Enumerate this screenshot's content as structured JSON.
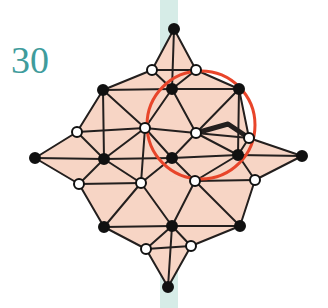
{
  "figure": {
    "label": "30",
    "label_color": "#3f9c9c",
    "background_color": "#ffffff",
    "fill_color": "#f7d5c5",
    "edge_color": "#231f1e",
    "circle_color": "#e8452a",
    "stripe_color": "#cfe9e3",
    "vertex_fill_black": "#111111",
    "vertex_fill_white": "#ffffff",
    "vertex_stroke": "#111111",
    "width": 328,
    "height": 308
  },
  "stripe": {
    "name": "vertical-mint-stripe",
    "x": 160,
    "y": 0,
    "width": 18,
    "height": 308
  },
  "circle": {
    "name": "highlight-circle",
    "cx": 201,
    "cy": 125,
    "r": 54,
    "stroke_width": 3
  },
  "bold_path": {
    "name": "highlighted-edge-path",
    "points": [
      [
        196,
        133
      ],
      [
        228,
        124
      ],
      [
        249,
        138
      ]
    ],
    "stroke_width": 5
  },
  "vertices": [
    {
      "id": "n-tip",
      "x": 174,
      "y": 29,
      "type": "black"
    },
    {
      "id": "nw-out",
      "x": 152,
      "y": 70,
      "type": "white"
    },
    {
      "id": "ne-out",
      "x": 196,
      "y": 70,
      "type": "white"
    },
    {
      "id": "nw-cnr",
      "x": 103,
      "y": 90,
      "type": "black"
    },
    {
      "id": "n-mid",
      "x": 172,
      "y": 89,
      "type": "black"
    },
    {
      "id": "ne-cnr",
      "x": 239,
      "y": 89,
      "type": "black"
    },
    {
      "id": "w-upin",
      "x": 77,
      "y": 132,
      "type": "white"
    },
    {
      "id": "c-upleft",
      "x": 145,
      "y": 128,
      "type": "white"
    },
    {
      "id": "c-upright",
      "x": 196,
      "y": 133,
      "type": "white"
    },
    {
      "id": "e-upin",
      "x": 249,
      "y": 138,
      "type": "white"
    },
    {
      "id": "w-tip",
      "x": 35,
      "y": 158,
      "type": "black"
    },
    {
      "id": "w-mid",
      "x": 104,
      "y": 159,
      "type": "black"
    },
    {
      "id": "c-mid",
      "x": 172,
      "y": 158,
      "type": "black"
    },
    {
      "id": "e-mid",
      "x": 238,
      "y": 155,
      "type": "black"
    },
    {
      "id": "e-tip",
      "x": 302,
      "y": 156,
      "type": "black"
    },
    {
      "id": "w-dnin",
      "x": 79,
      "y": 184,
      "type": "white"
    },
    {
      "id": "c-dnleft",
      "x": 141,
      "y": 183,
      "type": "white"
    },
    {
      "id": "c-dnright",
      "x": 195,
      "y": 181,
      "type": "white"
    },
    {
      "id": "e-dnin",
      "x": 255,
      "y": 180,
      "type": "white"
    },
    {
      "id": "sw-cnr",
      "x": 104,
      "y": 227,
      "type": "black"
    },
    {
      "id": "s-mid",
      "x": 172,
      "y": 226,
      "type": "black"
    },
    {
      "id": "se-cnr",
      "x": 240,
      "y": 226,
      "type": "black"
    },
    {
      "id": "sw-out",
      "x": 146,
      "y": 249,
      "type": "white"
    },
    {
      "id": "se-out",
      "x": 191,
      "y": 246,
      "type": "white"
    },
    {
      "id": "s-tip",
      "x": 168,
      "y": 287,
      "type": "black"
    }
  ],
  "edges": [
    [
      "n-tip",
      "nw-out"
    ],
    [
      "n-tip",
      "ne-out"
    ],
    [
      "n-tip",
      "n-mid"
    ],
    [
      "nw-out",
      "ne-out"
    ],
    [
      "nw-out",
      "n-mid"
    ],
    [
      "ne-out",
      "n-mid"
    ],
    [
      "nw-out",
      "nw-cnr"
    ],
    [
      "ne-out",
      "ne-cnr"
    ],
    [
      "nw-cnr",
      "n-mid"
    ],
    [
      "n-mid",
      "ne-cnr"
    ],
    [
      "nw-cnr",
      "c-upleft"
    ],
    [
      "nw-cnr",
      "w-upin"
    ],
    [
      "w-upin",
      "c-upleft"
    ],
    [
      "c-upleft",
      "n-mid"
    ],
    [
      "n-mid",
      "c-upright"
    ],
    [
      "c-upright",
      "ne-cnr"
    ],
    [
      "ne-cnr",
      "e-upin"
    ],
    [
      "c-upright",
      "e-upin"
    ],
    [
      "c-upleft",
      "c-upright"
    ],
    [
      "w-upin",
      "w-tip"
    ],
    [
      "w-upin",
      "w-mid"
    ],
    [
      "w-tip",
      "w-mid"
    ],
    [
      "w-tip",
      "w-dnin"
    ],
    [
      "w-mid",
      "w-dnin"
    ],
    [
      "w-mid",
      "c-upleft"
    ],
    [
      "c-upleft",
      "c-mid"
    ],
    [
      "c-mid",
      "c-upright"
    ],
    [
      "c-upright",
      "e-mid"
    ],
    [
      "e-mid",
      "e-upin"
    ],
    [
      "e-upin",
      "e-tip"
    ],
    [
      "e-mid",
      "e-tip"
    ],
    [
      "e-tip",
      "e-dnin"
    ],
    [
      "e-mid",
      "e-dnin"
    ],
    [
      "w-mid",
      "c-dnleft"
    ],
    [
      "w-dnin",
      "c-dnleft"
    ],
    [
      "c-upleft",
      "c-dnleft"
    ],
    [
      "c-mid",
      "c-dnleft"
    ],
    [
      "c-mid",
      "c-dnright"
    ],
    [
      "c-dnright",
      "e-mid"
    ],
    [
      "c-dnright",
      "e-dnin"
    ],
    [
      "c-mid",
      "e-mid"
    ],
    [
      "c-mid",
      "w-mid"
    ],
    [
      "w-dnin",
      "sw-cnr"
    ],
    [
      "c-dnleft",
      "sw-cnr"
    ],
    [
      "c-dnleft",
      "s-mid"
    ],
    [
      "c-dnright",
      "s-mid"
    ],
    [
      "c-dnright",
      "se-cnr"
    ],
    [
      "e-dnin",
      "se-cnr"
    ],
    [
      "sw-cnr",
      "s-mid"
    ],
    [
      "s-mid",
      "se-cnr"
    ],
    [
      "sw-cnr",
      "sw-out"
    ],
    [
      "sw-out",
      "s-mid"
    ],
    [
      "s-mid",
      "se-out"
    ],
    [
      "se-out",
      "se-cnr"
    ],
    [
      "sw-out",
      "se-out"
    ],
    [
      "sw-out",
      "s-tip"
    ],
    [
      "se-out",
      "s-tip"
    ],
    [
      "s-mid",
      "s-tip"
    ],
    [
      "nw-cnr",
      "w-mid"
    ],
    [
      "ne-cnr",
      "e-mid"
    ]
  ],
  "faces": [
    [
      "n-tip",
      "nw-out",
      "n-mid"
    ],
    [
      "n-tip",
      "n-mid",
      "ne-out"
    ],
    [
      "nw-out",
      "nw-cnr",
      "n-mid"
    ],
    [
      "ne-out",
      "n-mid",
      "ne-cnr"
    ],
    [
      "nw-cnr",
      "w-upin",
      "c-upleft"
    ],
    [
      "nw-cnr",
      "c-upleft",
      "n-mid"
    ],
    [
      "n-mid",
      "c-upleft",
      "c-upright"
    ],
    [
      "n-mid",
      "c-upright",
      "ne-cnr"
    ],
    [
      "ne-cnr",
      "c-upright",
      "e-upin"
    ],
    [
      "w-tip",
      "w-upin",
      "w-mid"
    ],
    [
      "w-tip",
      "w-mid",
      "w-dnin"
    ],
    [
      "w-upin",
      "c-upleft",
      "w-mid"
    ],
    [
      "c-upleft",
      "c-mid",
      "w-mid"
    ],
    [
      "c-upleft",
      "c-upright",
      "c-mid"
    ],
    [
      "c-upright",
      "e-mid",
      "c-mid"
    ],
    [
      "c-upright",
      "e-upin",
      "e-mid"
    ],
    [
      "e-upin",
      "e-tip",
      "e-mid"
    ],
    [
      "e-mid",
      "e-tip",
      "e-dnin"
    ],
    [
      "w-mid",
      "c-mid",
      "c-dnleft"
    ],
    [
      "w-mid",
      "c-dnleft",
      "w-dnin"
    ],
    [
      "c-mid",
      "c-dnright",
      "c-dnleft"
    ],
    [
      "c-mid",
      "e-mid",
      "c-dnright"
    ],
    [
      "c-dnright",
      "e-mid",
      "e-dnin"
    ],
    [
      "w-dnin",
      "c-dnleft",
      "sw-cnr"
    ],
    [
      "c-dnleft",
      "s-mid",
      "sw-cnr"
    ],
    [
      "c-dnleft",
      "c-dnright",
      "s-mid"
    ],
    [
      "c-dnright",
      "se-cnr",
      "s-mid"
    ],
    [
      "c-dnright",
      "e-dnin",
      "se-cnr"
    ],
    [
      "sw-cnr",
      "s-mid",
      "sw-out"
    ],
    [
      "s-mid",
      "se-cnr",
      "se-out"
    ],
    [
      "sw-out",
      "s-mid",
      "se-out"
    ],
    [
      "sw-out",
      "se-out",
      "s-tip"
    ],
    [
      "nw-cnr",
      "w-upin",
      "w-mid"
    ],
    [
      "nw-cnr",
      "w-mid",
      "w-mid"
    ],
    [
      "ne-cnr",
      "e-upin",
      "e-mid"
    ]
  ]
}
